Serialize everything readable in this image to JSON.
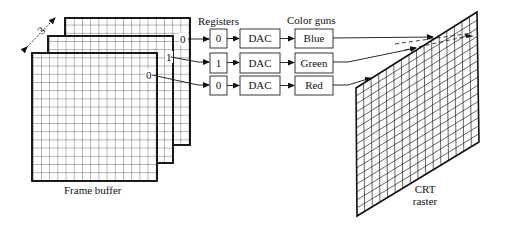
{
  "labels": {
    "registers": "Registers",
    "color_guns": "Color guns",
    "frame_buffer": "Frame buffer",
    "crt_line1": "CRT",
    "crt_line2": "raster",
    "depth": "3"
  },
  "plane_bits": [
    "0",
    "1",
    "0"
  ],
  "channels": [
    {
      "register": "0",
      "dac": "DAC",
      "gun": "Blue"
    },
    {
      "register": "1",
      "dac": "DAC",
      "gun": "Green"
    },
    {
      "register": "0",
      "dac": "DAC",
      "gun": "Red"
    }
  ]
}
